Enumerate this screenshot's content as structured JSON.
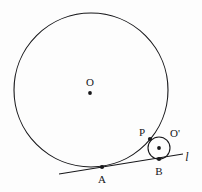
{
  "diagram": {
    "background_color": "#fdfdfd",
    "stroke_color": "#17171a",
    "labels": {
      "big_center": "O",
      "small_center": "O'",
      "tangent_point_big": "A",
      "tangent_point_small": "B",
      "circle_contact": "P",
      "line": "l"
    },
    "shapes": {
      "big_circle": {
        "name": "circle-O",
        "cx": 91,
        "cy": 90,
        "r": 77
      },
      "small_circle": {
        "name": "circle-O-prime",
        "cx": 159,
        "cy": 148,
        "r": 11
      },
      "tangent_line": {
        "name": "line-l",
        "x1": 59,
        "y1": 174,
        "x2": 183,
        "y2": 154
      }
    },
    "points": {
      "O": {
        "x": 90,
        "y": 93
      },
      "O_prime": {
        "x": 159,
        "y": 148
      },
      "A": {
        "x": 102,
        "y": 167
      },
      "B": {
        "x": 159,
        "y": 159
      },
      "P": {
        "x": 150,
        "y": 139
      }
    },
    "label_positions": {
      "O": {
        "x": 90,
        "y": 82
      },
      "O_prime": {
        "x": 175,
        "y": 133
      },
      "A": {
        "x": 102,
        "y": 179
      },
      "B": {
        "x": 159,
        "y": 171
      },
      "P": {
        "x": 142,
        "y": 132
      },
      "l": {
        "x": 187,
        "y": 157
      }
    }
  }
}
